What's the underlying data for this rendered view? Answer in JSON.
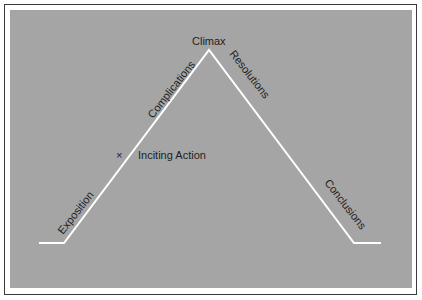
{
  "diagram": {
    "type": "plot-structure-triangle",
    "title": "",
    "colors": {
      "background": "#ffffff",
      "frame_border": "#3a3a3a",
      "panel": "#a5a5a5",
      "line": "#ffffff",
      "text": "#1e1e1e"
    },
    "path_points": [
      [
        39,
        243
      ],
      [
        64,
        243
      ],
      [
        209,
        50
      ],
      [
        354,
        243
      ],
      [
        381,
        243
      ]
    ],
    "labels": {
      "peak": "Climax",
      "exposition": "Exposition",
      "complications": "Complications",
      "resolutions": "Resolutions",
      "conclusions": "Conclusions",
      "inciting_action": "Inciting Action",
      "inciting_marker": "×"
    }
  }
}
